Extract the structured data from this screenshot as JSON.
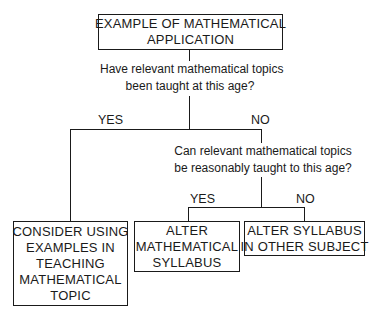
{
  "diagram": {
    "root": {
      "lines": [
        "EXAMPLE OF MATHEMATICAL",
        "APPLICATION"
      ]
    },
    "question1": {
      "lines": [
        "Have relevant mathematical topics",
        "been taught at this age?"
      ]
    },
    "question1_yes": "YES",
    "question1_no": "NO",
    "question2": {
      "lines": [
        "Can relevant mathematical topics",
        "be reasonably taught to this age?"
      ]
    },
    "question2_yes": "YES",
    "question2_no": "NO",
    "outcome_consider": {
      "lines": [
        "CONSIDER USING",
        "EXAMPLES IN",
        "TEACHING",
        "MATHEMATICAL",
        "TOPIC"
      ]
    },
    "outcome_alter_math": {
      "lines": [
        "ALTER",
        "MATHEMATICAL",
        "SYLLABUS"
      ]
    },
    "outcome_alter_other": {
      "lines": [
        "ALTER SYLLABUS",
        "IN OTHER SUBJECT"
      ]
    }
  }
}
